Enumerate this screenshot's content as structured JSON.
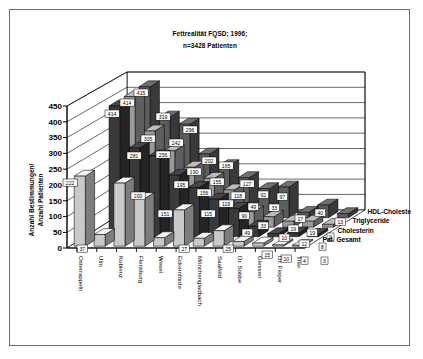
{
  "chart_data": {
    "type": "bar",
    "title": "Fettrealität FQSD; 1996;",
    "subtitle": "n=3428 Patienten",
    "xlabel": "",
    "ylabel": "Anzahl Bestimmungen/ Anzahl Patienten",
    "ylim": [
      0,
      450
    ],
    "yticks": [
      0,
      50,
      100,
      150,
      200,
      250,
      300,
      350,
      400,
      450
    ],
    "grid": true,
    "legend_position": "right",
    "projection": "3d",
    "categories": [
      "Osterrappeln",
      "Ulm",
      "Koblenz",
      "Flensburg",
      "Wesel",
      "Eckernförde",
      "Mönchengladbach",
      "Saalfeld",
      "Dr. Sobbe",
      "Giessen",
      "Dr. Pieper",
      "Trier"
    ],
    "series": [
      {
        "name": "Pat. Gesamt",
        "color": "#c9c9c9",
        "values": [
          222,
          37,
          200,
          151,
          27,
          115,
          25,
          49,
          15,
          10,
          4,
          3
        ]
      },
      {
        "name": "Cholesterin",
        "color": "#3a3a3a",
        "values": [
          0,
          414,
          281,
          256,
          195,
          156,
          119,
          90,
          33,
          10,
          12,
          8
        ]
      },
      {
        "name": "Triglyceride",
        "color": "#9a9a9a",
        "values": [
          0,
          414,
          305,
          242,
          190,
          155,
          118,
          49,
          33,
          19,
          19,
          9
        ]
      },
      {
        "name": "HDL-Cholesterin",
        "color": "#5c5c5c",
        "values": [
          0,
          415,
          319,
          296,
          202,
          165,
          127,
          92,
          97,
          17,
          40,
          13
        ]
      }
    ],
    "value_labels": [
      {
        "text": "222",
        "x": 53,
        "y": 169
      },
      {
        "text": "37",
        "y": 235,
        "x": 67
      },
      {
        "text": "414",
        "x": 95,
        "y": 100
      },
      {
        "text": "414",
        "x": 110,
        "y": 89
      },
      {
        "text": "415",
        "x": 124,
        "y": 79
      },
      {
        "text": "200",
        "x": 121,
        "y": 182
      },
      {
        "text": "281",
        "x": 117,
        "y": 142
      },
      {
        "text": "305",
        "x": 131,
        "y": 125
      },
      {
        "text": "319",
        "x": 146,
        "y": 103
      },
      {
        "text": "151",
        "x": 148,
        "y": 200
      },
      {
        "text": "256",
        "x": 146,
        "y": 141
      },
      {
        "text": "242",
        "x": 159,
        "y": 129
      },
      {
        "text": "296",
        "x": 173,
        "y": 116
      },
      {
        "text": "27",
        "x": 169,
        "y": 235
      },
      {
        "text": "195",
        "x": 164,
        "y": 171
      },
      {
        "text": "190",
        "x": 177,
        "y": 158
      },
      {
        "text": "202",
        "x": 192,
        "y": 147
      },
      {
        "text": "115",
        "x": 191,
        "y": 200
      },
      {
        "text": "156",
        "x": 187,
        "y": 179
      },
      {
        "text": "155",
        "x": 200,
        "y": 168
      },
      {
        "text": "165",
        "x": 209,
        "y": 152
      },
      {
        "text": "25",
        "x": 213,
        "y": 235
      },
      {
        "text": "119",
        "x": 209,
        "y": 190
      },
      {
        "text": "118",
        "x": 221,
        "y": 182
      },
      {
        "text": "127",
        "x": 230,
        "y": 170
      },
      {
        "text": "49",
        "x": 232,
        "y": 219
      },
      {
        "text": "90",
        "x": 229,
        "y": 202
      },
      {
        "text": "49",
        "x": 238,
        "y": 193
      },
      {
        "text": "92",
        "x": 248,
        "y": 181
      },
      {
        "text": "15",
        "x": 252,
        "y": 241
      },
      {
        "text": "33",
        "x": 248,
        "y": 212
      },
      {
        "text": "33",
        "x": 259,
        "y": 194
      },
      {
        "text": "97",
        "x": 267,
        "y": 183
      },
      {
        "text": "10",
        "x": 271,
        "y": 245
      },
      {
        "text": "10",
        "x": 269,
        "y": 224
      },
      {
        "text": "19",
        "x": 278,
        "y": 215
      },
      {
        "text": "17",
        "x": 285,
        "y": 205
      },
      {
        "text": "4",
        "x": 291,
        "y": 247
      },
      {
        "text": "12",
        "x": 289,
        "y": 230
      },
      {
        "text": "19",
        "x": 297,
        "y": 219
      },
      {
        "text": "40",
        "x": 305,
        "y": 199
      },
      {
        "text": "3",
        "x": 311,
        "y": 247
      },
      {
        "text": "8",
        "x": 309,
        "y": 233
      },
      {
        "text": "9",
        "x": 317,
        "y": 223
      },
      {
        "text": "13",
        "x": 325,
        "y": 208
      }
    ]
  },
  "axis": {
    "tick_labels": [
      "450",
      "400",
      "350",
      "300",
      "250",
      "200",
      "150",
      "100",
      "50",
      "0"
    ],
    "y_title_line1": "Anzahl Bestimmungen/",
    "y_title_line2": "Anzahl Patienten"
  }
}
